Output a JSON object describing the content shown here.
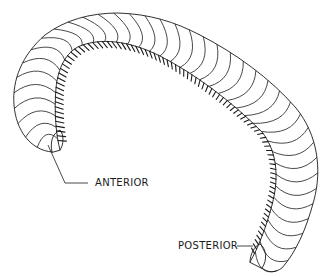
{
  "figure": {
    "labels": {
      "anterior": "ANTERIOR",
      "posterior": "POSTERIOR"
    },
    "colors": {
      "ink": "#1a1a1a",
      "background": "#ffffff"
    }
  }
}
